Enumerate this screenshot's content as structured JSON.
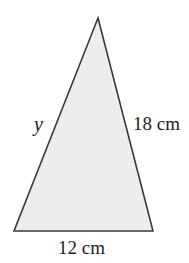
{
  "figure": {
    "type": "triangle",
    "background_color": "#ffffff",
    "fill_color": "#ededed",
    "stroke_color": "#3a3a3a",
    "stroke_width": 1.6,
    "vertices": {
      "apex": {
        "x": 98,
        "y": 18
      },
      "bottom_left": {
        "x": 14,
        "y": 231
      },
      "bottom_right": {
        "x": 153,
        "y": 231
      }
    },
    "labels": {
      "left_side": "y",
      "right_side": "18 cm",
      "base": "12 cm"
    },
    "measurements": [
      {
        "side": "right",
        "value": 18,
        "unit": "cm",
        "text": "18 cm",
        "known": true
      },
      {
        "side": "base",
        "value": 12,
        "unit": "cm",
        "text": "12 cm",
        "known": true
      },
      {
        "side": "left",
        "value": null,
        "unit": "cm",
        "text": "y",
        "known": false
      }
    ]
  }
}
